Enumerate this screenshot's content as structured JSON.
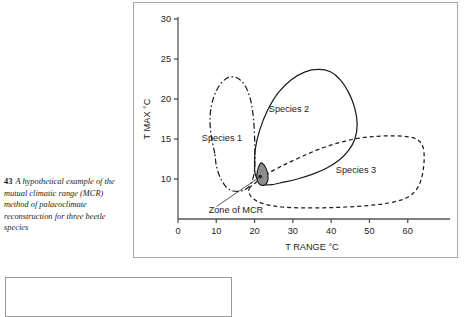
{
  "caption": {
    "figure_number": "43",
    "text": "A hypothetical example of the mutual climatic range (MCR) method of palaeoclimate reconstruction for three beetle species"
  },
  "chart_data": {
    "type": "line",
    "title": "",
    "xlabel": "T RANGE °C",
    "ylabel": "T MAX °C",
    "xlim": [
      0,
      70
    ],
    "ylim": [
      5,
      30
    ],
    "xticks": [
      0,
      10,
      20,
      30,
      40,
      50,
      60
    ],
    "xtick_labels": [
      "0",
      "10",
      "20",
      "30",
      "40",
      "50",
      "60"
    ],
    "yticks": [
      10,
      15,
      20,
      25,
      30
    ],
    "ytick_labels": [
      "10",
      "15",
      "20",
      "25",
      "30"
    ],
    "grid": false,
    "legend_position": "inline-labels",
    "annotations": [
      {
        "text": "Zone of MCR",
        "x": 8,
        "y": 6.2,
        "points_to_x": 21.5,
        "points_to_y": 10.3
      }
    ],
    "series": [
      {
        "name": "Species 1",
        "linestyle": "dashdot",
        "color": "#1d1d1d",
        "label_x": 11.5,
        "label_y": 15.2,
        "polygon": [
          [
            9.6,
            13.2
          ],
          [
            8.6,
            15.6
          ],
          [
            8.4,
            18.0
          ],
          [
            9.3,
            20.2
          ],
          [
            11.0,
            21.8
          ],
          [
            13.2,
            22.7
          ],
          [
            15.6,
            22.6
          ],
          [
            17.6,
            21.6
          ],
          [
            19.0,
            19.8
          ],
          [
            19.7,
            17.6
          ],
          [
            20.0,
            15.3
          ],
          [
            20.1,
            13.1
          ],
          [
            20.0,
            11.2
          ],
          [
            19.4,
            9.8
          ],
          [
            18.2,
            8.9
          ],
          [
            16.5,
            8.5
          ],
          [
            14.4,
            8.5
          ],
          [
            12.6,
            9.0
          ],
          [
            11.0,
            10.2
          ],
          [
            10.0,
            11.7
          ]
        ]
      },
      {
        "name": "Species 2",
        "linestyle": "solid",
        "color": "#1d1d1d",
        "label_x": 29.0,
        "label_y": 18.8,
        "polygon": [
          [
            20.0,
            11.8
          ],
          [
            20.2,
            13.8
          ],
          [
            21.4,
            16.2
          ],
          [
            23.4,
            18.6
          ],
          [
            26.2,
            20.8
          ],
          [
            29.6,
            22.4
          ],
          [
            33.2,
            23.4
          ],
          [
            36.8,
            23.7
          ],
          [
            39.8,
            23.4
          ],
          [
            42.4,
            22.4
          ],
          [
            44.6,
            20.8
          ],
          [
            46.2,
            18.8
          ],
          [
            46.8,
            16.8
          ],
          [
            46.2,
            15.0
          ],
          [
            44.6,
            13.6
          ],
          [
            42.2,
            12.4
          ],
          [
            39.0,
            11.4
          ],
          [
            35.2,
            10.6
          ],
          [
            31.2,
            10.0
          ],
          [
            27.6,
            9.6
          ],
          [
            24.6,
            9.3
          ],
          [
            22.4,
            9.3
          ],
          [
            20.8,
            9.9
          ],
          [
            20.1,
            10.8
          ]
        ]
      },
      {
        "name": "Species 3",
        "linestyle": "dashed",
        "color": "#1d1d1d",
        "label_x": 46.5,
        "label_y": 11.2,
        "polygon": [
          [
            18.6,
            8.8
          ],
          [
            20.4,
            9.6
          ],
          [
            23.2,
            10.6
          ],
          [
            27.0,
            11.6
          ],
          [
            31.4,
            12.6
          ],
          [
            36.2,
            13.6
          ],
          [
            41.0,
            14.4
          ],
          [
            46.0,
            15.0
          ],
          [
            51.0,
            15.3
          ],
          [
            55.8,
            15.4
          ],
          [
            59.8,
            15.3
          ],
          [
            62.6,
            14.9
          ],
          [
            64.0,
            14.0
          ],
          [
            64.3,
            12.6
          ],
          [
            64.0,
            11.0
          ],
          [
            63.2,
            9.5
          ],
          [
            61.6,
            8.3
          ],
          [
            59.0,
            7.5
          ],
          [
            55.0,
            7.0
          ],
          [
            50.0,
            6.7
          ],
          [
            44.0,
            6.5
          ],
          [
            38.0,
            6.4
          ],
          [
            32.0,
            6.4
          ],
          [
            27.0,
            6.5
          ],
          [
            23.2,
            6.8
          ],
          [
            20.4,
            7.3
          ],
          [
            18.8,
            8.0
          ]
        ]
      }
    ],
    "shaded_region": {
      "name": "Zone of MCR overlap",
      "fill": "#8e8e8e",
      "edge": "#1d1d1d",
      "polygon": [
        [
          21.6,
          12.0
        ],
        [
          22.4,
          11.8
        ],
        [
          23.1,
          11.2
        ],
        [
          23.5,
          10.4
        ],
        [
          23.4,
          9.7
        ],
        [
          22.8,
          9.3
        ],
        [
          22.0,
          9.2
        ],
        [
          21.2,
          9.4
        ],
        [
          20.7,
          9.9
        ],
        [
          20.6,
          10.6
        ],
        [
          20.9,
          11.3
        ]
      ]
    }
  }
}
